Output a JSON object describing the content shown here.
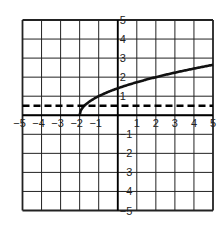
{
  "chart_data": {
    "type": "line",
    "title": "",
    "xlabel": "",
    "ylabel": "",
    "xlim": [
      -5,
      5
    ],
    "ylim": [
      -5,
      5
    ],
    "grid": true,
    "x_ticks": [
      -5,
      -4,
      -3,
      -2,
      -1,
      1,
      2,
      3,
      4,
      5
    ],
    "y_ticks": [
      -5,
      -4,
      -3,
      -2,
      -1,
      1,
      2,
      3,
      4,
      5
    ],
    "x_tick_labels": [
      "−5",
      "−4",
      "−3",
      "−2",
      "−1",
      "1",
      "2",
      "3",
      "4",
      "5"
    ],
    "y_tick_labels": [
      "−5",
      "−4",
      "−3",
      "−2",
      "−1",
      "1",
      "2",
      "3",
      "4",
      "5"
    ],
    "series": [
      {
        "name": "curve",
        "style": "solid",
        "function": "y = sqrt(x + 2)",
        "x": [
          -2,
          -1.75,
          -1.5,
          -1,
          -0.5,
          0,
          1,
          2,
          3,
          4,
          5
        ],
        "y": [
          0,
          0.5,
          0.71,
          1.0,
          1.22,
          1.41,
          1.73,
          2.0,
          2.24,
          2.45,
          2.65
        ]
      },
      {
        "name": "dashed-line",
        "style": "dashed",
        "function": "y = 0.5",
        "x": [
          -5,
          5
        ],
        "y": [
          0.5,
          0.5
        ]
      }
    ]
  },
  "colors": {
    "grid": "#222222",
    "curve": "#111111",
    "background": "#ffffff"
  }
}
